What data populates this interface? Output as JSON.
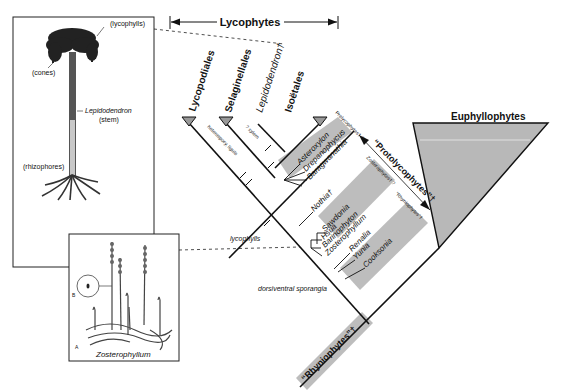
{
  "header": {
    "lycophytes_label": "Lycophytes"
  },
  "clades": {
    "euphyllophytes": "Euphyllophytes",
    "lycopodiales": "Lycopodiales",
    "selaginellales": "Selaginellales",
    "lepidodendron": "Lepidodendron†",
    "isoetales": "Isoëtales",
    "prelycophytes": "Prelycophytes† ?",
    "protolycophytes": "“Protolycophytes”†",
    "zosterophytes": "Zosterophytes† ?",
    "rhyniophytes_small": "“Rhyniophytes”†",
    "rhyniophytes": "“Rhyniophytes”†"
  },
  "characters": {
    "heterospory": "heterospory, ligule",
    "xylem": "? xylem",
    "lycophylls": "lycophylls",
    "dorsiventral": "dorsiventral sporangia"
  },
  "taxa": {
    "group1": [
      "Asteroxylon",
      "Drepanophycus",
      "Baragwanathia"
    ],
    "nothia": "Nothia†",
    "group2": [
      "Sawdonia",
      "Hsua",
      "Barinophyton",
      "Zosterophyllum"
    ],
    "group3": [
      "Renalia",
      "Yunia",
      "Cooksonia"
    ]
  },
  "inset_lepidodendron": {
    "lycophylls": "(lycophylls)",
    "cones": "(cones)",
    "name": "Lepidodendron",
    "stem": "(stem)",
    "rhizophores": "(rhizophores)"
  },
  "inset_zosterophyllum": {
    "name": "Zosterophyllum",
    "label_a": "A",
    "label_b": "B"
  },
  "colors": {
    "shade": "#bdbdbd",
    "euphyllophyte_fill": "#b8b8b8",
    "line": "#111111"
  }
}
